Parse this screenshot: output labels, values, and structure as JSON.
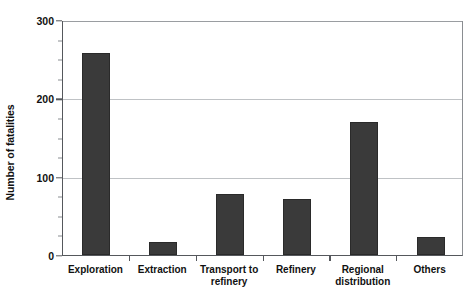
{
  "chart_data": {
    "type": "bar",
    "title": "",
    "subtitle": "",
    "xlabel": "",
    "ylabel": "Number of fatalities",
    "categories": [
      "Exploration",
      "Extraction",
      "Transport to\nrefinery",
      "Refinery",
      "Regional\ndistribution",
      "Others"
    ],
    "values": [
      258,
      16,
      78,
      72,
      170,
      23
    ],
    "ylim": [
      0,
      300
    ],
    "y_major_ticks": [
      0,
      100,
      200,
      300
    ],
    "y_major_tick_labels": [
      "0",
      "100",
      "200",
      "300"
    ],
    "y_minor_tick_interval": 25,
    "gridlines": {
      "horizontal_at": [
        100,
        200,
        300
      ],
      "vertical": false
    },
    "legend": {
      "visible": false,
      "position": "none",
      "entries": []
    },
    "annotations": [],
    "bar_color": "#3a3a3a",
    "bar_edge_color": "#2a2a2a",
    "axis_color": "#55585c",
    "grid_color": "#bfc2c5",
    "background_color": "#ffffff",
    "bar_width_fraction": 0.42
  }
}
